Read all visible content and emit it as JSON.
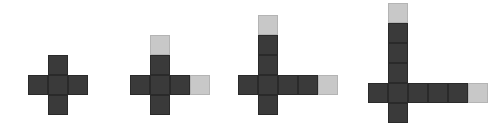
{
  "figure": {
    "width": 499,
    "height": 130,
    "background_color": "#ffffff",
    "cell_size": 20,
    "colors": {
      "dark": "#3a3a3a",
      "light": "#c8c8c8",
      "grid_line": "#dcdcdc"
    }
  },
  "shapes": [
    {
      "name": "figure-1",
      "label": "Figure 1",
      "square_count": 5,
      "dark_count": 5,
      "light_count": 0,
      "origin_x": 28,
      "origin_y": 55,
      "cells": [
        {
          "col": 1,
          "row": 0,
          "shade": "dark"
        },
        {
          "col": 0,
          "row": 1,
          "shade": "dark"
        },
        {
          "col": 1,
          "row": 1,
          "shade": "dark"
        },
        {
          "col": 2,
          "row": 1,
          "shade": "dark"
        },
        {
          "col": 1,
          "row": 2,
          "shade": "dark"
        }
      ]
    },
    {
      "name": "figure-2",
      "label": "Figure 2",
      "square_count": 7,
      "dark_count": 6,
      "light_count": 1,
      "origin_x": 130,
      "origin_y": 35,
      "cells": [
        {
          "col": 1,
          "row": 0,
          "shade": "light"
        },
        {
          "col": 1,
          "row": 1,
          "shade": "dark"
        },
        {
          "col": 0,
          "row": 2,
          "shade": "dark"
        },
        {
          "col": 1,
          "row": 2,
          "shade": "dark"
        },
        {
          "col": 2,
          "row": 2,
          "shade": "dark"
        },
        {
          "col": 3,
          "row": 2,
          "shade": "light"
        },
        {
          "col": 1,
          "row": 3,
          "shade": "dark"
        }
      ]
    },
    {
      "name": "figure-3",
      "label": "Figure 3",
      "square_count": 9,
      "dark_count": 7,
      "light_count": 2,
      "origin_x": 238,
      "origin_y": 15,
      "cells": [
        {
          "col": 1,
          "row": 0,
          "shade": "light"
        },
        {
          "col": 1,
          "row": 1,
          "shade": "dark"
        },
        {
          "col": 1,
          "row": 2,
          "shade": "dark"
        },
        {
          "col": 0,
          "row": 3,
          "shade": "dark"
        },
        {
          "col": 1,
          "row": 3,
          "shade": "dark"
        },
        {
          "col": 2,
          "row": 3,
          "shade": "dark"
        },
        {
          "col": 3,
          "row": 3,
          "shade": "dark"
        },
        {
          "col": 4,
          "row": 3,
          "shade": "light"
        },
        {
          "col": 1,
          "row": 4,
          "shade": "dark"
        }
      ]
    },
    {
      "name": "figure-4",
      "label": "Figure 4",
      "square_count": 11,
      "dark_count": 9,
      "light_count": 2,
      "origin_x": 368,
      "origin_y": 3,
      "cells": [
        {
          "col": 1,
          "row": 0,
          "shade": "light"
        },
        {
          "col": 1,
          "row": 1,
          "shade": "dark"
        },
        {
          "col": 1,
          "row": 2,
          "shade": "dark"
        },
        {
          "col": 1,
          "row": 3,
          "shade": "dark"
        },
        {
          "col": 0,
          "row": 4,
          "shade": "dark"
        },
        {
          "col": 1,
          "row": 4,
          "shade": "dark"
        },
        {
          "col": 2,
          "row": 4,
          "shade": "dark"
        },
        {
          "col": 3,
          "row": 4,
          "shade": "dark"
        },
        {
          "col": 4,
          "row": 4,
          "shade": "dark"
        },
        {
          "col": 5,
          "row": 4,
          "shade": "light"
        },
        {
          "col": 1,
          "row": 5,
          "shade": "dark"
        }
      ]
    }
  ]
}
